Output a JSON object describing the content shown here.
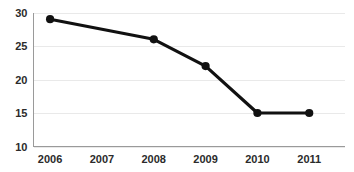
{
  "chart_data": {
    "type": "line",
    "title": "",
    "subtitle": "",
    "xlabel": "",
    "ylabel": "",
    "categories": [
      "2006",
      "2007",
      "2008",
      "2009",
      "2010",
      "2011"
    ],
    "values": [
      29,
      null,
      26,
      22,
      15,
      15
    ],
    "series": [
      {
        "name": "",
        "values": [
          29,
          null,
          26,
          22,
          15,
          15
        ]
      }
    ],
    "markers_at": [
      "2006",
      "2008",
      "2009",
      "2010",
      "2011"
    ],
    "ylim": [
      10,
      30
    ],
    "yticks": [
      10,
      15,
      20,
      25,
      30
    ],
    "ytick_labels": [
      "10",
      "15",
      "20",
      "25",
      "30"
    ],
    "xtick_labels": [
      "2006",
      "2007",
      "2008",
      "2009",
      "2010",
      "2011"
    ],
    "grid": true,
    "grid_axis": "y",
    "legend": false,
    "legend_position": "none",
    "colors": {
      "line": "#111111",
      "marker": "#111111",
      "grid": "#e9e9e9",
      "axis": "#9a9a9a",
      "text": "#2b2b2b",
      "background": "#ffffff"
    }
  }
}
